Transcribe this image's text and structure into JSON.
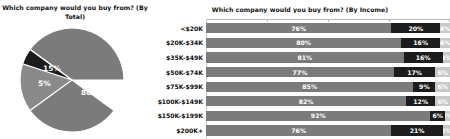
{
  "pie": {
    "title": "Which company would you buy from? (By Total)",
    "labels": [
      "80%",
      "15%",
      "5%"
    ]
  },
  "bars": {
    "title": "Which company would you buy from? (By Income)"
  },
  "chart_data": [
    {
      "type": "pie",
      "title": "Which company would you buy from? (By Total)",
      "categories": [
        "Series 1",
        "Series 2",
        "Series 3"
      ],
      "values": [
        80,
        15,
        5
      ],
      "data_labels": [
        "80%",
        "15%",
        "5%"
      ],
      "colors": [
        "#7b7b7b",
        "#8a8a8a",
        "#1c1c1c"
      ],
      "legend": "none",
      "grid": false
    },
    {
      "type": "bar",
      "orientation": "horizontal",
      "stacked": true,
      "title": "Which company would you buy from? (By Income)",
      "xlabel": "",
      "ylabel": "",
      "xlim": [
        0,
        100
      ],
      "grid": false,
      "legend": "none",
      "categories": [
        "<$20K",
        "$20K-$34K",
        "$35K-$49K",
        "$50K-$74K",
        "$75K-$99K",
        "$100K-$149K",
        "$150K-$199K",
        "$200K+"
      ],
      "series": [
        {
          "name": "Series 1",
          "color": "#7b7b7b",
          "values": [
            76,
            80,
            81,
            77,
            85,
            82,
            92,
            76
          ]
        },
        {
          "name": "Series 2",
          "color": "#1c1c1c",
          "values": [
            20,
            16,
            16,
            17,
            9,
            12,
            6,
            21
          ]
        },
        {
          "name": "Series 3",
          "color": "#c9c9c9",
          "values": [
            4,
            4,
            3,
            6,
            6,
            6,
            2,
            3
          ]
        }
      ],
      "rows": [
        {
          "category": "<$20K",
          "a": "76%",
          "b": "20%",
          "c": "4%"
        },
        {
          "category": "$20K-$34K",
          "a": "80%",
          "b": "16%",
          "c": "4%"
        },
        {
          "category": "$35K-$49K",
          "a": "81%",
          "b": "16%",
          "c": "3%"
        },
        {
          "category": "$50K-$74K",
          "a": "77%",
          "b": "17%",
          "c": "6%"
        },
        {
          "category": "$75K-$99K",
          "a": "85%",
          "b": "9%",
          "c": "6%"
        },
        {
          "category": "$100K-$149K",
          "a": "82%",
          "b": "12%",
          "c": "6%"
        },
        {
          "category": "$150K-$199K",
          "a": "92%",
          "b": "6%",
          "c": "2%"
        },
        {
          "category": "$200K+",
          "a": "76%",
          "b": "21%",
          "c": "3%"
        }
      ]
    }
  ]
}
